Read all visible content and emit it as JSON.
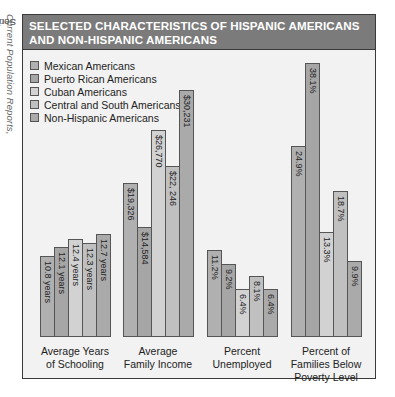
{
  "source": {
    "prefix": "Source: ",
    "italic": "Current Population Reports,",
    "rest": " Series p-20, No. 416, 1987"
  },
  "header": {
    "line1": "SELECTED CHARACTERISTICS OF HISPANIC AMERICANS",
    "line2": "AND NON-HISPANIC AMERICANS"
  },
  "legend": [
    {
      "label": "Mexican Americans",
      "color": "#b0b0b0"
    },
    {
      "label": "Puerto Rican Americans",
      "color": "#a6a6a6"
    },
    {
      "label": "Cuban Americans",
      "color": "#d2d2d2"
    },
    {
      "label": "Central and South Americans",
      "color": "#c0c0c0"
    },
    {
      "label": "Non-Hispanic Americans",
      "color": "#aaaaaa"
    }
  ],
  "chart_data": {
    "type": "bar",
    "title": "SELECTED CHARACTERISTICS OF HISPANIC AMERICANS AND NON-HISPANIC AMERICANS",
    "series_names": [
      "Mexican Americans",
      "Puerto Rican Americans",
      "Cuban Americans",
      "Central and South Americans",
      "Non-Hispanic Americans"
    ],
    "groups": [
      {
        "name": "Average Years of Schooling",
        "lines": [
          "Average Years",
          "of Schooling"
        ],
        "values": [
          10.8,
          12.1,
          12.4,
          12.3,
          12.7
        ],
        "labels": [
          "10.8 years",
          "12.1 years",
          "12.4 years",
          "12.3 years",
          "12.7 years"
        ],
        "heights": [
          81,
          90,
          98,
          94,
          103
        ]
      },
      {
        "name": "Average Family Income",
        "lines": [
          "Average",
          "Family Income"
        ],
        "values": [
          19326,
          14584,
          26770,
          22246,
          30231
        ],
        "labels": [
          "$19,326",
          "$14,584",
          "$26,770",
          "$22, 246",
          "$30,231"
        ],
        "heights": [
          154,
          110,
          207,
          171,
          247
        ]
      },
      {
        "name": "Percent Unemployed",
        "lines": [
          "Percent",
          "Unemployed"
        ],
        "values": [
          11.2,
          9.2,
          6.4,
          8.1,
          6.4
        ],
        "labels": [
          "11.2%",
          "9.2%",
          "6.4%",
          "8.1%",
          "6.4%"
        ],
        "heights": [
          87,
          73,
          48,
          61,
          48
        ]
      },
      {
        "name": "Percent of Families Below Poverty Level",
        "lines": [
          "Percent of",
          "Families Below",
          "Poverty Level"
        ],
        "values": [
          24.9,
          38.1,
          13.3,
          18.7,
          9.9
        ],
        "labels": [
          "24.9%",
          "38.1%",
          "13.3%",
          "18.7%",
          "9.9%"
        ],
        "heights": [
          191,
          274,
          105,
          146,
          76
        ]
      }
    ],
    "xlabel": "",
    "ylabel": "",
    "grid": false,
    "legend_position": "top-left"
  }
}
